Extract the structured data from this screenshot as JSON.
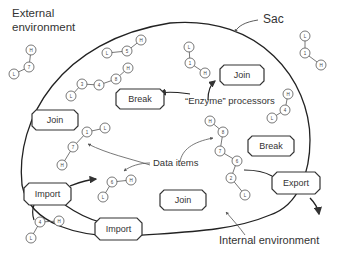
{
  "labels": {
    "external_environment_line1": "External",
    "external_environment_line2": "environment",
    "sac": "Sac",
    "enzyme_processors": "“Enzyme” processors",
    "data_items": "Data items",
    "internal_environment": "Internal environment"
  },
  "processors": [
    {
      "id": "join-top",
      "label": "Join"
    },
    {
      "id": "break-top",
      "label": "Break"
    },
    {
      "id": "join-left",
      "label": "Join"
    },
    {
      "id": "break-right",
      "label": "Break"
    },
    {
      "id": "import-left",
      "label": "Import"
    },
    {
      "id": "export-right",
      "label": "Export"
    },
    {
      "id": "join-bottom",
      "label": "Join"
    },
    {
      "id": "import-bottom",
      "label": "Import"
    }
  ],
  "data_items": [
    {
      "location": "external-top-left",
      "nodes": [
        "L",
        "7",
        "H"
      ]
    },
    {
      "location": "internal-top",
      "nodes": [
        "L",
        "5",
        "H"
      ]
    },
    {
      "location": "internal-chain",
      "nodes": [
        "L",
        "3",
        "4",
        "8",
        "H"
      ]
    },
    {
      "location": "internal-near-join",
      "nodes": [
        "L",
        "1",
        "H"
      ]
    },
    {
      "location": "external-top-right",
      "nodes": [
        "L",
        "1",
        "H"
      ]
    },
    {
      "location": "internal-right",
      "nodes": [
        "L",
        "4",
        "H"
      ]
    },
    {
      "location": "internal-left-middle",
      "nodes": [
        "L",
        "1",
        "7",
        "H"
      ]
    },
    {
      "location": "internal-long-chain",
      "nodes": [
        "H",
        "8",
        "7",
        "6",
        "2",
        "L"
      ]
    },
    {
      "location": "internal-center",
      "nodes": [
        "L",
        "6",
        "H"
      ]
    },
    {
      "location": "external-bottom-left",
      "nodes": [
        "L",
        "4",
        "H"
      ]
    }
  ]
}
